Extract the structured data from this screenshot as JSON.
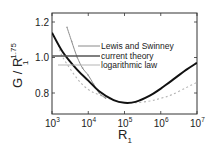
{
  "chart_data": {
    "type": "line",
    "title": "",
    "xlabel": "R",
    "xlabel_subscript": "1",
    "ylabel": "G / R",
    "ylabel_subscript": "1",
    "ylabel_superscript": "1.75",
    "xscale": "log",
    "xlim": [
      1000,
      10000000
    ],
    "ylim": [
      0.68,
      1.25
    ],
    "grid": false,
    "legend_position": "inside upper right (leader-line annotations)",
    "x_ticks": [
      {
        "base": "10",
        "exp": "3",
        "value": 1000
      },
      {
        "base": "10",
        "exp": "4",
        "value": 10000
      },
      {
        "base": "10",
        "exp": "5",
        "value": 100000
      },
      {
        "base": "10",
        "exp": "6",
        "value": 1000000
      },
      {
        "base": "10",
        "exp": "7",
        "value": 10000000
      }
    ],
    "y_ticks": [
      {
        "label": "0.8",
        "value": 0.8
      },
      {
        "label": "1.0",
        "value": 1.0
      },
      {
        "label": "1.2",
        "value": 1.2
      }
    ],
    "series": [
      {
        "name": "Lewis and Swinney",
        "style": "thin grey line with dot markers",
        "color": "#8a8a8a",
        "x": [
          2600,
          3500,
          5000,
          7000,
          10000,
          14000,
          20000,
          30000
        ],
        "y": [
          1.17,
          1.09,
          1.0,
          0.94,
          0.9,
          0.85,
          0.8,
          0.77
        ]
      },
      {
        "name": "current theory",
        "style": "thick solid black line",
        "color": "#111111",
        "x": [
          1000,
          2000,
          5000,
          10000,
          20000,
          50000,
          100000,
          200000,
          500000,
          1000000,
          2000000,
          5000000,
          10000000
        ],
        "y": [
          1.14,
          1.03,
          0.93,
          0.87,
          0.81,
          0.76,
          0.745,
          0.75,
          0.785,
          0.825,
          0.87,
          0.93,
          0.97
        ]
      },
      {
        "name": "logarithmic law",
        "style": "light grey dashed line",
        "color": "#b5b5b5",
        "x": [
          1500,
          2000,
          5000,
          10000,
          20000,
          50000,
          100000,
          200000,
          500000,
          1000000,
          2000000,
          5000000,
          10000000
        ],
        "y": [
          1.07,
          1.0,
          0.88,
          0.82,
          0.79,
          0.76,
          0.745,
          0.745,
          0.755,
          0.77,
          0.79,
          0.83,
          0.86
        ]
      }
    ]
  },
  "axes": {
    "x_title": "R",
    "x_title_sub": "1",
    "y_title_main": "G / R",
    "y_title_sub": "1",
    "y_title_sup": "1.75"
  },
  "legend": {
    "items": [
      {
        "label": "Lewis and Swinney"
      },
      {
        "label": "current theory"
      },
      {
        "label": "logarithmic law"
      }
    ]
  }
}
